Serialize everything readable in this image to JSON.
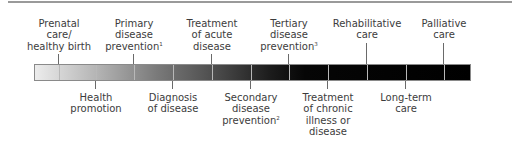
{
  "diagram": {
    "type": "continuum",
    "colors": {
      "bar_start": "#ececec",
      "bar_end": "#000000",
      "rule": "#9a9a9a",
      "text": "#3c3c3c"
    },
    "top_labels": [
      {
        "lines": [
          "Prenatal",
          "care/",
          "healthy birth"
        ],
        "sup": "",
        "x": 59
      },
      {
        "lines": [
          "Primary",
          "disease",
          "prevention"
        ],
        "sup": "1",
        "x": 134
      },
      {
        "lines": [
          "Treatment",
          "of acute",
          "disease"
        ],
        "sup": "",
        "x": 212
      },
      {
        "lines": [
          "Tertiary",
          "disease",
          "prevention"
        ],
        "sup": "3",
        "x": 289
      },
      {
        "lines": [
          "Rehabilitative",
          "care"
        ],
        "sup": "",
        "x": 367
      },
      {
        "lines": [
          "Palliative",
          "care"
        ],
        "sup": "",
        "x": 444
      }
    ],
    "bottom_labels": [
      {
        "lines": [
          "Health",
          "promotion"
        ],
        "sup": "",
        "x": 96
      },
      {
        "lines": [
          "Diagnosis",
          "of disease"
        ],
        "sup": "",
        "x": 173
      },
      {
        "lines": [
          "Secondary",
          "disease",
          "prevention"
        ],
        "sup": "2",
        "x": 251
      },
      {
        "lines": [
          "Treatment",
          "of chronic",
          "illness or",
          "disease"
        ],
        "sup": "",
        "x": 328
      },
      {
        "lines": [
          "Long-term",
          "care"
        ],
        "sup": "",
        "x": 406
      }
    ]
  }
}
